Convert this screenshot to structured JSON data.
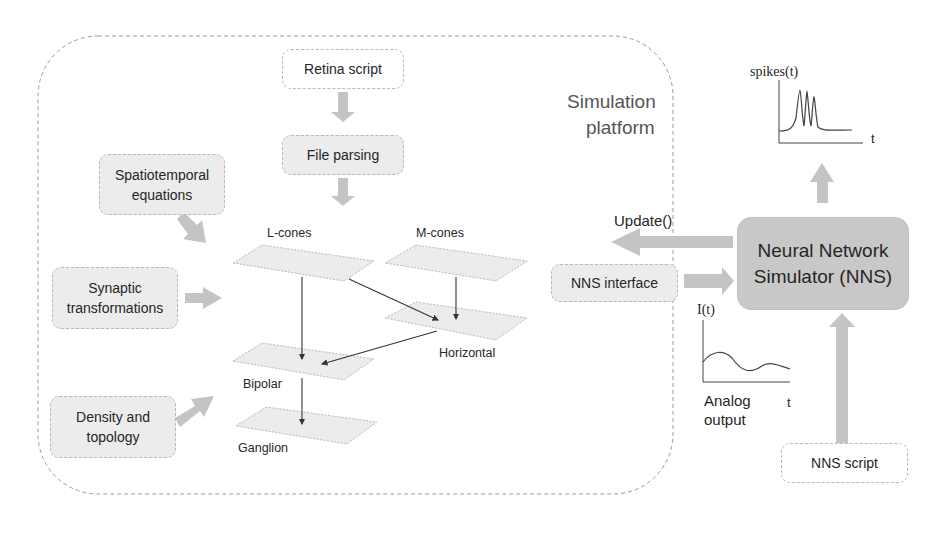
{
  "platform": {
    "title_line1": "Simulation",
    "title_line2": "platform"
  },
  "boxes": {
    "retina_script": "Retina script",
    "file_parsing": "File parsing",
    "spatiotemporal_l1": "Spatiotemporal",
    "spatiotemporal_l2": "equations",
    "synaptic_l1": "Synaptic",
    "synaptic_l2": "transformations",
    "density_l1": "Density and",
    "density_l2": "topology",
    "nns_interface": "NNS interface",
    "nns_l1": "Neural Network",
    "nns_l2": "Simulator (NNS)",
    "nns_script": "NNS script"
  },
  "layers": {
    "l_cones": "L-cones",
    "m_cones": "M-cones",
    "horizontal": "Horizontal",
    "bipolar": "Bipolar",
    "ganglion": "Ganglion"
  },
  "signals": {
    "update": "Update()",
    "input_current": "I(t)",
    "analog_l1": "Analog",
    "analog_l2": "output",
    "time_axis": "t",
    "spikes": "spikes(t)",
    "spikes_time_axis": "t"
  },
  "colors": {
    "arrow": "#c4c4c4",
    "layer_fill": "#ececec",
    "nns_fill": "#c8c8c8",
    "box_fill": "#ececec",
    "dashed_border": "#9a9a9a"
  }
}
